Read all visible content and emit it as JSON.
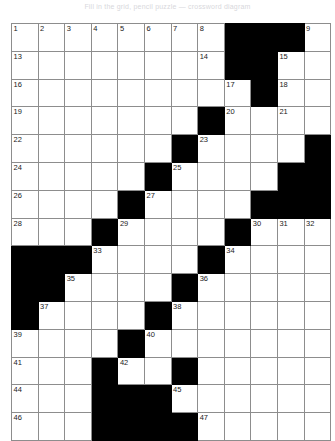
{
  "caption": {
    "text": "Fill in the grid, pencil puzzle — crossword diagram"
  },
  "puzzle": {
    "type": "crossword-grid",
    "rows": 12,
    "cols": 12,
    "cell_color": "#ffffff",
    "block_color": "#000000",
    "line_color": "#8d8d8d",
    "number_color": "#1a1a1a",
    "numbers_total": 47,
    "grid": [
      [
        "1",
        "2",
        "3",
        "4",
        "5",
        "6",
        "7",
        "8",
        "#",
        "#",
        "#",
        "9",
        "10",
        "11",
        "12"
      ],
      [
        "13",
        "",
        "",
        "",
        "",
        "",
        "",
        "14",
        "#",
        "#",
        "15",
        "",
        "",
        ""
      ],
      [
        "16",
        "",
        "",
        "",
        "",
        "",
        "",
        "",
        "17",
        "#",
        "18",
        "",
        "",
        ""
      ],
      [
        "19",
        "",
        "",
        "",
        "",
        "",
        "",
        "#",
        "20",
        "",
        "21",
        "",
        "",
        ""
      ],
      [
        "22",
        "",
        "",
        "",
        "",
        "",
        "#",
        "23",
        "",
        "",
        "",
        "",
        "",
        ""
      ]
    ],
    "cells": [
      [
        {
          "n": "1"
        },
        {
          "n": "2"
        },
        {
          "n": "3"
        },
        {
          "n": "4"
        },
        {
          "n": "5"
        },
        {
          "n": "6"
        },
        {
          "n": "7"
        },
        {
          "n": "8"
        },
        {
          "b": true
        },
        {
          "b": true
        },
        {
          "b": true
        },
        {
          "n": "9"
        }
      ],
      [
        {
          "n": "13"
        },
        {},
        {},
        {},
        {},
        {},
        {},
        {
          "n": "14"
        },
        {
          "b": true
        },
        {
          "b": true
        },
        {
          "b": true
        },
        {
          "n": "15"
        }
      ],
      [
        {
          "n": "16"
        },
        {},
        {},
        {},
        {},
        {},
        {},
        {},
        {
          "n": "17"
        },
        {
          "b": true
        },
        {
          "b": true
        },
        {
          "n": "18"
        }
      ],
      [
        {
          "n": "19"
        },
        {},
        {},
        {},
        {},
        {},
        {},
        {
          "b": true
        },
        {
          "n": "20"
        },
        {},
        {
          "n": "21"
        },
        {}
      ],
      [
        {
          "n": "22"
        },
        {},
        {},
        {},
        {},
        {},
        {
          "b": true
        },
        {
          "n": "23"
        },
        {},
        {},
        {},
        {}
      ],
      [
        {
          "n": "24"
        },
        {},
        {},
        {},
        {},
        {
          "b": true
        },
        {
          "n": "25"
        },
        {},
        {},
        {},
        {},
        {
          "b": true
        }
      ],
      [
        {
          "n": "26"
        },
        {},
        {},
        {},
        {
          "b": true
        },
        {
          "n": "27"
        },
        {},
        {},
        {},
        {},
        {
          "b": true
        },
        {
          "b": true
        }
      ],
      [
        {
          "n": "28"
        },
        {},
        {},
        {
          "b": true
        },
        {
          "n": "29"
        },
        {},
        {},
        {},
        {},
        {
          "b": true
        },
        {
          "n": "30"
        },
        {
          "n": "31"
        }
      ],
      [
        {
          "b": true
        },
        {
          "b": true
        },
        {
          "b": true
        },
        {
          "n": "33"
        },
        {},
        {},
        {},
        {},
        {
          "b": true
        },
        {
          "n": "34"
        },
        {},
        {}
      ],
      [
        {
          "b": true
        },
        {
          "b": true
        },
        {
          "n": "35"
        },
        {},
        {},
        {},
        {},
        {
          "b": true
        },
        {
          "n": "36"
        },
        {},
        {},
        {}
      ],
      [
        {
          "b": true
        },
        {
          "n": "37"
        },
        {},
        {},
        {},
        {},
        {
          "b": true
        },
        {
          "n": "38"
        },
        {},
        {},
        {},
        {}
      ],
      [
        {
          "n": "39"
        },
        {},
        {},
        {},
        {},
        {
          "b": true
        },
        {
          "n": "40"
        },
        {},
        {},
        {},
        {},
        {}
      ]
    ]
  }
}
